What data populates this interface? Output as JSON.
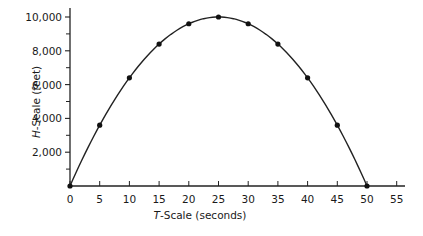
{
  "chart_data": {
    "type": "line",
    "title": "",
    "xlabel": "T-Scale (seconds)",
    "xlabel_italic_prefix": "T",
    "xlabel_rest": "-Scale (seconds)",
    "ylabel": "H-Scale (feet)",
    "ylabel_italic_prefix": "H",
    "ylabel_rest": "-Scale (feet)",
    "xlim": [
      0,
      55
    ],
    "ylim": [
      0,
      10000
    ],
    "x_ticks": [
      0,
      5,
      10,
      15,
      20,
      25,
      30,
      35,
      40,
      45,
      50,
      55
    ],
    "x_tick_labels": [
      "0",
      "5",
      "10",
      "15",
      "20",
      "25",
      "30",
      "35",
      "40",
      "45",
      "50",
      "55"
    ],
    "y_major_ticks": [
      2000,
      4000,
      6000,
      8000,
      10000
    ],
    "y_tick_labels": [
      "2,000",
      "4,000",
      "6,000",
      "8,000",
      "10,000"
    ],
    "y_minor_ticks": [
      1000,
      3000,
      5000,
      7000,
      9000
    ],
    "grid": false,
    "legend": null,
    "series": [
      {
        "name": "height",
        "x": [
          0,
          5,
          10,
          15,
          20,
          25,
          30,
          35,
          40,
          45,
          50
        ],
        "values": [
          0,
          3600,
          6400,
          8400,
          9600,
          10000,
          9600,
          8400,
          6400,
          3600,
          0
        ],
        "markers": true,
        "curve": "smooth parabola"
      }
    ]
  }
}
